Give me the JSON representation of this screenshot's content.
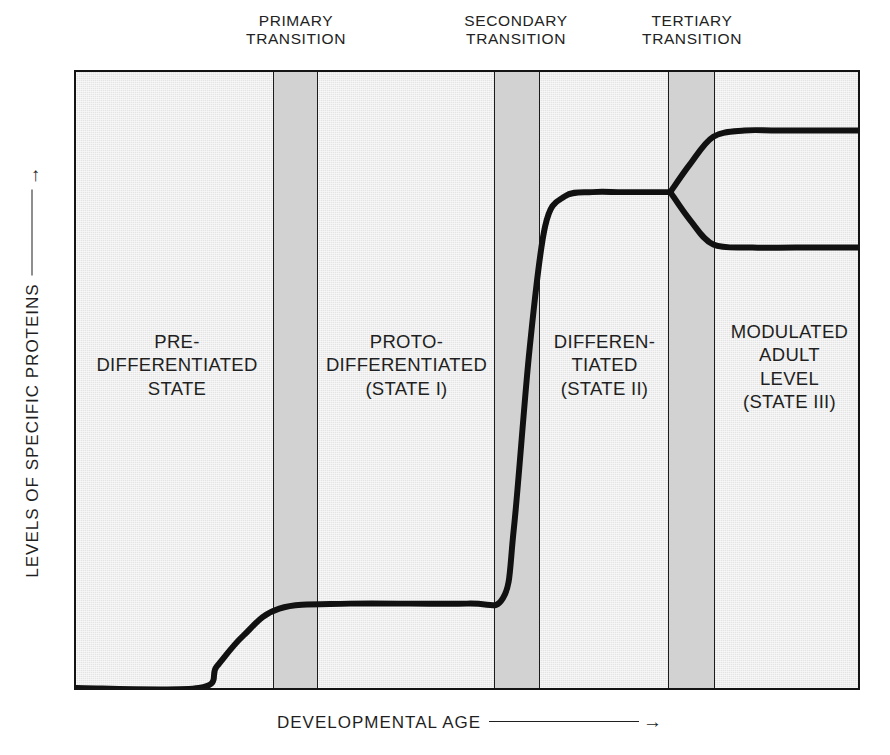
{
  "figure": {
    "transitions": [
      {
        "id": "primary",
        "label": "PRIMARY\nTRANSITION"
      },
      {
        "id": "secondary",
        "label": "SECONDARY\nTRANSITION"
      },
      {
        "id": "tertiary",
        "label": "TERTIARY\nTRANSITION"
      }
    ],
    "regions": [
      {
        "id": "pre",
        "label": "PRE-\nDIFFERENTIATED\nSTATE"
      },
      {
        "id": "proto",
        "label": "PROTO-\nDIFFERENTIATED\n(STATE I)"
      },
      {
        "id": "diff",
        "label": "DIFFEREN-\nTIATED\n(STATE II)"
      },
      {
        "id": "mod",
        "label": "MODULATED\nADULT\nLEVEL\n(STATE III)"
      }
    ],
    "axes": {
      "y_label": "LEVELS OF SPECIFIC PROTEINS",
      "y_arrow": "↑",
      "x_label": "DEVELOPMENTAL AGE",
      "x_arrow": "→"
    },
    "colors": {
      "plot_background": "#e4e4e4",
      "transition_band": "#d2d2d2",
      "frame": "#141414",
      "curve": "#111111",
      "text": "#1f1f1f"
    }
  },
  "chart_data": {
    "type": "line",
    "title": "",
    "xlabel": "DEVELOPMENTAL AGE",
    "ylabel": "LEVELS OF SPECIFIC PROTEINS",
    "grid": false,
    "legend": "none",
    "axis_ticks": "none",
    "xlim": [
      0,
      100
    ],
    "ylim": [
      0,
      100
    ],
    "annotations": {
      "transition_bands": [
        {
          "name": "PRIMARY TRANSITION",
          "x_start": 15.7,
          "x_end": 21.4
        },
        {
          "name": "SECONDARY TRANSITION",
          "x_start": 53.2,
          "x_end": 59.0
        },
        {
          "name": "TERTIARY TRANSITION",
          "x_start": 75.3,
          "x_end": 81.3
        }
      ],
      "regions": [
        {
          "name": "PRE-DIFFERENTIATED STATE",
          "x_start": 0.0,
          "x_end": 15.7
        },
        {
          "name": "PROTO-DIFFERENTIATED (STATE I)",
          "x_start": 21.4,
          "x_end": 53.2
        },
        {
          "name": "DIFFERENTIATED (STATE II)",
          "x_start": 59.0,
          "x_end": 75.3
        },
        {
          "name": "MODULATED ADULT LEVEL (STATE III)",
          "x_start": 81.3,
          "x_end": 100.0
        }
      ]
    },
    "series": [
      {
        "name": "specific protein level (main)",
        "x": [
          0,
          15.7,
          18,
          21.4,
          26,
          35,
          50,
          54.6,
          56,
          58,
          60,
          62.5,
          66,
          70,
          76.0
        ],
        "y": [
          0,
          0,
          3.5,
          8.5,
          12.9,
          13.7,
          13.7,
          14.6,
          26,
          55,
          75,
          79.8,
          80.5,
          80.5,
          80.5
        ]
      },
      {
        "name": "upper modulated adult level",
        "x": [
          76.0,
          78.5,
          81.5,
          85.5,
          90,
          100
        ],
        "y": [
          80.5,
          85,
          89.5,
          90.5,
          90.5,
          90.5
        ]
      },
      {
        "name": "lower modulated adult level",
        "x": [
          76.0,
          78.5,
          81.5,
          86.5,
          92,
          100
        ],
        "y": [
          80.5,
          76,
          72,
          71.5,
          71.5,
          71.5
        ]
      }
    ]
  }
}
